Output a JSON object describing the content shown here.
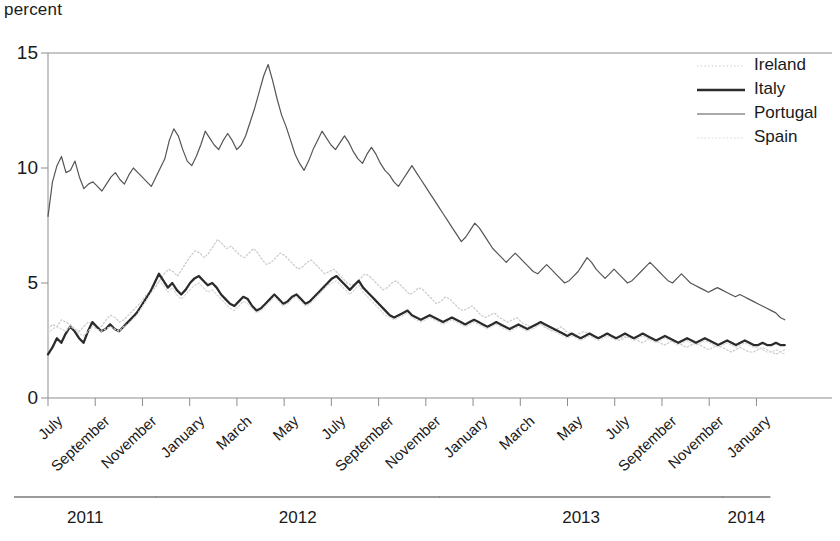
{
  "chart_data": {
    "type": "line",
    "title": "",
    "ylabel": "percent",
    "xlabel": "",
    "ylim": [
      0,
      15
    ],
    "yticks": [
      0,
      5,
      10,
      15
    ],
    "ytick_labels": [
      "0",
      "5",
      "10",
      "15"
    ],
    "grid": false,
    "legend_position": "top-right",
    "xtick_labels": [
      "July",
      "September",
      "November",
      "January",
      "March",
      "May",
      "July",
      "September",
      "November",
      "January",
      "March",
      "May",
      "July",
      "September",
      "November",
      "January"
    ],
    "year_groups": [
      {
        "label": "2011",
        "start_tick": 0,
        "end_tick": 2
      },
      {
        "label": "2012",
        "start_tick": 3,
        "end_tick": 8
      },
      {
        "label": "2013",
        "start_tick": 9,
        "end_tick": 14
      },
      {
        "label": "2014",
        "start_tick": 15,
        "end_tick": 15
      }
    ],
    "x_start": "2011-07",
    "x_end": "2014-02",
    "series": [
      {
        "name": "Ireland",
        "style": "dotted",
        "color": "#c9c9c9",
        "width": 1.2,
        "values": [
          3.0,
          3.2,
          3.1,
          3.4,
          3.3,
          3.2,
          3.0,
          2.9,
          3.1,
          3.3,
          3.2,
          3.0,
          3.1,
          3.4,
          3.6,
          3.5,
          3.3,
          3.4,
          3.6,
          3.8,
          4.0,
          4.2,
          4.5,
          4.6,
          4.8,
          5.1,
          5.4,
          5.6,
          5.5,
          5.3,
          5.6,
          5.9,
          6.2,
          6.4,
          6.3,
          6.1,
          6.3,
          6.6,
          6.9,
          6.7,
          6.5,
          6.6,
          6.4,
          6.2,
          6.1,
          6.3,
          6.5,
          6.3,
          6.0,
          5.8,
          5.9,
          6.1,
          6.3,
          6.2,
          6.0,
          5.8,
          5.6,
          5.7,
          5.9,
          6.0,
          5.8,
          5.6,
          5.4,
          5.5,
          5.6,
          5.4,
          5.2,
          5.0,
          4.9,
          5.0,
          5.2,
          5.4,
          5.3,
          5.1,
          4.9,
          4.7,
          4.8,
          5.0,
          5.1,
          4.9,
          4.7,
          4.5,
          4.6,
          4.8,
          4.7,
          4.5,
          4.3,
          4.1,
          4.2,
          4.4,
          4.3,
          4.1,
          3.9,
          3.8,
          3.9,
          4.0,
          3.8,
          3.6,
          3.5,
          3.6,
          3.7,
          3.5,
          3.4,
          3.3,
          3.4,
          3.5,
          3.3,
          3.2,
          3.1,
          3.2,
          3.3,
          3.1,
          3.0,
          2.9,
          3.0,
          3.1,
          2.9,
          2.8,
          2.7,
          2.8,
          2.9,
          2.8,
          2.7,
          2.6,
          2.7,
          2.8,
          2.7,
          2.6,
          2.5,
          2.6,
          2.7,
          2.6,
          2.5,
          2.4,
          2.5,
          2.6,
          2.5,
          2.4,
          2.3,
          2.4,
          2.5,
          2.4,
          2.3,
          2.2,
          2.3,
          2.4,
          2.3,
          2.2,
          2.1,
          2.2,
          2.3,
          2.2,
          2.1,
          2.0,
          2.1,
          2.2,
          2.1,
          2.0,
          2.0,
          2.1,
          2.2,
          2.1,
          2.0,
          1.9,
          2.0,
          2.1
        ]
      },
      {
        "name": "Italy",
        "style": "solid",
        "color": "#2b2b2b",
        "width": 2.3,
        "values": [
          1.9,
          2.2,
          2.6,
          2.4,
          2.8,
          3.1,
          2.9,
          2.6,
          2.4,
          2.9,
          3.3,
          3.1,
          2.9,
          3.0,
          3.2,
          3.0,
          2.9,
          3.1,
          3.3,
          3.5,
          3.7,
          4.0,
          4.3,
          4.6,
          5.0,
          5.4,
          5.1,
          4.8,
          5.0,
          4.7,
          4.5,
          4.7,
          5.0,
          5.2,
          5.3,
          5.1,
          4.9,
          5.0,
          4.8,
          4.5,
          4.3,
          4.1,
          4.0,
          4.2,
          4.4,
          4.3,
          4.0,
          3.8,
          3.9,
          4.1,
          4.3,
          4.5,
          4.3,
          4.1,
          4.2,
          4.4,
          4.5,
          4.3,
          4.1,
          4.2,
          4.4,
          4.6,
          4.8,
          5.0,
          5.2,
          5.3,
          5.1,
          4.9,
          4.7,
          4.9,
          5.1,
          4.8,
          4.6,
          4.4,
          4.2,
          4.0,
          3.8,
          3.6,
          3.5,
          3.6,
          3.7,
          3.8,
          3.6,
          3.5,
          3.4,
          3.5,
          3.6,
          3.5,
          3.4,
          3.3,
          3.4,
          3.5,
          3.4,
          3.3,
          3.2,
          3.3,
          3.4,
          3.3,
          3.2,
          3.1,
          3.2,
          3.3,
          3.2,
          3.1,
          3.0,
          3.1,
          3.2,
          3.1,
          3.0,
          3.1,
          3.2,
          3.3,
          3.2,
          3.1,
          3.0,
          2.9,
          2.8,
          2.7,
          2.8,
          2.7,
          2.6,
          2.7,
          2.8,
          2.7,
          2.6,
          2.7,
          2.8,
          2.7,
          2.6,
          2.7,
          2.8,
          2.7,
          2.6,
          2.7,
          2.8,
          2.7,
          2.6,
          2.5,
          2.6,
          2.7,
          2.6,
          2.5,
          2.4,
          2.5,
          2.6,
          2.5,
          2.4,
          2.5,
          2.6,
          2.5,
          2.4,
          2.3,
          2.4,
          2.5,
          2.4,
          2.3,
          2.4,
          2.5,
          2.4,
          2.3,
          2.3,
          2.4,
          2.3,
          2.3,
          2.4,
          2.3,
          2.3
        ]
      },
      {
        "name": "Portugal",
        "style": "solid",
        "color": "#555555",
        "width": 1.2,
        "values": [
          7.9,
          9.4,
          10.1,
          10.5,
          9.8,
          9.9,
          10.3,
          9.6,
          9.1,
          9.3,
          9.4,
          9.2,
          9.0,
          9.3,
          9.6,
          9.8,
          9.5,
          9.3,
          9.7,
          10.0,
          9.8,
          9.6,
          9.4,
          9.2,
          9.6,
          10.0,
          10.4,
          11.2,
          11.7,
          11.4,
          10.8,
          10.3,
          10.1,
          10.5,
          11.0,
          11.6,
          11.3,
          11.0,
          10.8,
          11.2,
          11.5,
          11.2,
          10.8,
          11.0,
          11.4,
          12.0,
          12.6,
          13.3,
          14.0,
          14.5,
          13.8,
          13.0,
          12.3,
          11.8,
          11.2,
          10.6,
          10.2,
          9.9,
          10.3,
          10.8,
          11.2,
          11.6,
          11.3,
          11.0,
          10.8,
          11.1,
          11.4,
          11.1,
          10.7,
          10.4,
          10.2,
          10.6,
          10.9,
          10.6,
          10.2,
          9.9,
          9.7,
          9.4,
          9.2,
          9.5,
          9.8,
          10.1,
          9.8,
          9.5,
          9.2,
          8.9,
          8.6,
          8.3,
          8.0,
          7.7,
          7.4,
          7.1,
          6.8,
          7.0,
          7.3,
          7.6,
          7.4,
          7.1,
          6.8,
          6.5,
          6.3,
          6.1,
          5.9,
          6.1,
          6.3,
          6.1,
          5.9,
          5.7,
          5.5,
          5.4,
          5.6,
          5.8,
          5.6,
          5.4,
          5.2,
          5.0,
          5.1,
          5.3,
          5.5,
          5.8,
          6.1,
          5.9,
          5.6,
          5.4,
          5.2,
          5.4,
          5.6,
          5.4,
          5.2,
          5.0,
          5.1,
          5.3,
          5.5,
          5.7,
          5.9,
          5.7,
          5.5,
          5.3,
          5.1,
          5.0,
          5.2,
          5.4,
          5.2,
          5.0,
          4.9,
          4.8,
          4.7,
          4.6,
          4.7,
          4.8,
          4.7,
          4.6,
          4.5,
          4.4,
          4.5,
          4.4,
          4.3,
          4.2,
          4.1,
          4.0,
          3.9,
          3.8,
          3.7,
          3.5,
          3.4
        ]
      },
      {
        "name": "Spain",
        "style": "dotted",
        "color": "#d5d5d5",
        "width": 1.2,
        "values": [
          2.8,
          3.0,
          3.1,
          3.0,
          2.9,
          3.1,
          3.0,
          2.8,
          2.7,
          2.9,
          3.1,
          3.0,
          2.9,
          3.0,
          3.1,
          3.0,
          2.9,
          3.1,
          3.2,
          3.4,
          3.6,
          3.9,
          4.2,
          4.5,
          4.8,
          5.1,
          4.9,
          4.6,
          4.8,
          4.5,
          4.3,
          4.5,
          4.7,
          4.9,
          5.0,
          4.8,
          4.6,
          4.7,
          4.5,
          4.3,
          4.1,
          3.9,
          3.8,
          4.0,
          4.2,
          4.1,
          3.9,
          3.7,
          3.8,
          4.0,
          4.2,
          4.4,
          4.2,
          4.0,
          4.1,
          4.3,
          4.4,
          4.2,
          4.0,
          4.1,
          4.3,
          4.5,
          4.7,
          4.9,
          5.0,
          5.1,
          4.9,
          4.7,
          4.5,
          4.7,
          4.9,
          4.6,
          4.4,
          4.2,
          4.0,
          3.8,
          3.6,
          3.5,
          3.4,
          3.5,
          3.6,
          3.7,
          3.5,
          3.4,
          3.3,
          3.4,
          3.5,
          3.4,
          3.3,
          3.2,
          3.3,
          3.4,
          3.3,
          3.2,
          3.1,
          3.2,
          3.3,
          3.2,
          3.1,
          3.0,
          3.1,
          3.2,
          3.1,
          3.0,
          2.9,
          3.0,
          3.1,
          3.0,
          2.9,
          3.0,
          3.1,
          3.2,
          3.1,
          3.0,
          2.9,
          2.8,
          2.7,
          2.6,
          2.7,
          2.6,
          2.5,
          2.6,
          2.7,
          2.6,
          2.5,
          2.6,
          2.7,
          2.6,
          2.5,
          2.6,
          2.7,
          2.6,
          2.5,
          2.6,
          2.7,
          2.6,
          2.5,
          2.4,
          2.5,
          2.6,
          2.5,
          2.4,
          2.3,
          2.4,
          2.5,
          2.4,
          2.3,
          2.4,
          2.5,
          2.4,
          2.3,
          2.2,
          2.3,
          2.4,
          2.3,
          2.2,
          2.3,
          2.4,
          2.3,
          2.2,
          2.2,
          2.1,
          2.0,
          2.0,
          2.1,
          2.0,
          1.9
        ]
      }
    ]
  },
  "legend": {
    "items": [
      {
        "label": "Ireland"
      },
      {
        "label": "Italy"
      },
      {
        "label": "Portugal"
      },
      {
        "label": "Spain"
      }
    ]
  },
  "axis": {
    "unit_label": "percent"
  }
}
